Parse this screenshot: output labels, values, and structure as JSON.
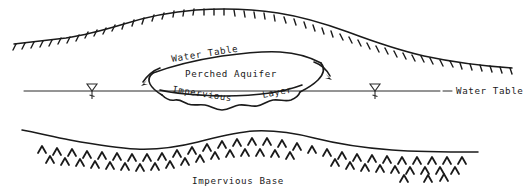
{
  "diagram": {
    "type": "hydrogeology-cross-section",
    "style": "hand-drawn line diagram, black ink on white",
    "colors": {
      "ink": "#1a1a1a",
      "line": "#2b2b2b",
      "background": "#ffffff"
    }
  },
  "labels": {
    "water_table_perched": "Water Table",
    "perched_aquifer": "Perched Aquifer",
    "impervious": "Impervious",
    "layer": "Layer",
    "water_table_regional": "Water Table",
    "impervious_base": "Impervious Base"
  },
  "symbols": {
    "water_table_marker_left": "inverted-triangle-water-table-symbol",
    "water_table_marker_right": "inverted-triangle-water-table-symbol",
    "ground_surface_hachures": "downward-tick-hachure",
    "bedrock_chevrons": "upward-caret-hatching",
    "seepage_arrow_left": "curved-arrow-pointing-down-left",
    "seepage_arrow_right": "curved-arrow-pointing-down-right"
  },
  "features": [
    {
      "name": "ground-surface",
      "description": "undulating land surface with hachure ticks"
    },
    {
      "name": "perched-aquifer-lens",
      "description": "closed lens-shaped body above the regional water table"
    },
    {
      "name": "impervious-layer",
      "description": "irregular low-permeability lens base supporting perched water"
    },
    {
      "name": "regional-water-table",
      "description": "horizontal water table line across full width"
    },
    {
      "name": "impervious-base",
      "description": "lower confining bedrock boundary with chevron hatching"
    }
  ]
}
